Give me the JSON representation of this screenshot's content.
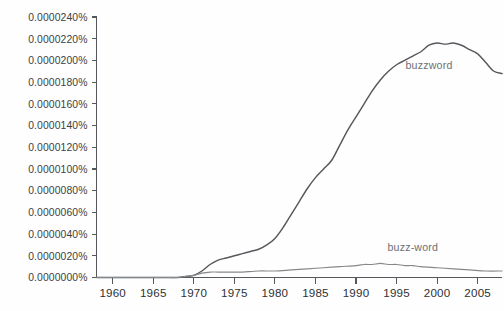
{
  "chart_data": {
    "type": "line",
    "title": "",
    "subtitle": "",
    "xlabel": "",
    "ylabel": "",
    "grid": false,
    "legend_position": "inline-labels",
    "xlim": [
      1958,
      2008
    ],
    "ylim": [
      0.0,
      2.4e-05
    ],
    "x_tick_labels": [
      "1960",
      "1965",
      "1970",
      "1975",
      "1980",
      "1985",
      "1990",
      "1995",
      "2000",
      "2005"
    ],
    "x_ticks": [
      1960,
      1965,
      1970,
      1975,
      1980,
      1985,
      1990,
      1995,
      2000,
      2005
    ],
    "y_tick_labels": [
      "0.0000000%",
      "0.0000020%",
      "0.0000040%",
      "0.0000060%",
      "0.0000080%",
      "0.0000100%",
      "0.0000120%",
      "0.0000140%",
      "0.0000160%",
      "0.0000180%",
      "0.0000200%",
      "0.0000220%",
      "0.0000240%"
    ],
    "y_ticks": [
      0.0,
      2e-06,
      4e-06,
      6e-06,
      8e-06,
      1e-05,
      1.2e-05,
      1.4e-05,
      1.6e-05,
      1.8e-05,
      2e-05,
      2.2e-05,
      2.4e-05
    ],
    "series": [
      {
        "name": "buzzword",
        "color": "#55585c",
        "label_x": 1999,
        "label_y": 1.92e-05,
        "x": [
          1958,
          1960,
          1962,
          1964,
          1966,
          1968,
          1969,
          1970,
          1971,
          1972,
          1973,
          1974,
          1975,
          1976,
          1977,
          1978,
          1979,
          1980,
          1981,
          1982,
          1983,
          1984,
          1985,
          1986,
          1987,
          1988,
          1989,
          1990,
          1991,
          1992,
          1993,
          1994,
          1995,
          1996,
          1997,
          1998,
          1999,
          2000,
          2001,
          2002,
          2003,
          2004,
          2005,
          2006,
          2007,
          2008
        ],
        "y": [
          0.0,
          0.0,
          0.0,
          0.0,
          0.0,
          0.0,
          1e-07,
          2e-07,
          6e-07,
          1.2e-06,
          1.6e-06,
          1.8e-06,
          2e-06,
          2.2e-06,
          2.4e-06,
          2.6e-06,
          3e-06,
          3.6e-06,
          4.6e-06,
          5.8e-06,
          7e-06,
          8.2e-06,
          9.2e-06,
          1e-05,
          1.08e-05,
          1.22e-05,
          1.36e-05,
          1.48e-05,
          1.6e-05,
          1.72e-05,
          1.82e-05,
          1.9e-05,
          1.96e-05,
          2e-05,
          2.04e-05,
          2.08e-05,
          2.14e-05,
          2.16e-05,
          2.15e-05,
          2.16e-05,
          2.14e-05,
          2.1e-05,
          2.06e-05,
          1.98e-05,
          1.9e-05,
          1.88e-05
        ]
      },
      {
        "name": "buzz-word",
        "color": "#85888b",
        "label_x": 1997,
        "label_y": 2.4e-06,
        "x": [
          1958,
          1962,
          1966,
          1968,
          1969,
          1970,
          1971,
          1972,
          1973,
          1974,
          1975,
          1976,
          1978,
          1980,
          1982,
          1984,
          1986,
          1988,
          1990,
          1991,
          1992,
          1993,
          1994,
          1995,
          1996,
          1997,
          1998,
          2000,
          2002,
          2004,
          2006,
          2008
        ],
        "y": [
          0.0,
          0.0,
          0.0,
          0.0,
          1e-07,
          2e-07,
          4e-07,
          5e-07,
          5e-07,
          5e-07,
          5e-07,
          5e-07,
          6e-07,
          6e-07,
          7e-07,
          8e-07,
          9e-07,
          1e-06,
          1.1e-06,
          1.2e-06,
          1.2e-06,
          1.3e-06,
          1.2e-06,
          1.2e-06,
          1.1e-06,
          1.1e-06,
          1e-06,
          9e-07,
          8e-07,
          7e-07,
          6e-07,
          6e-07
        ]
      }
    ]
  }
}
